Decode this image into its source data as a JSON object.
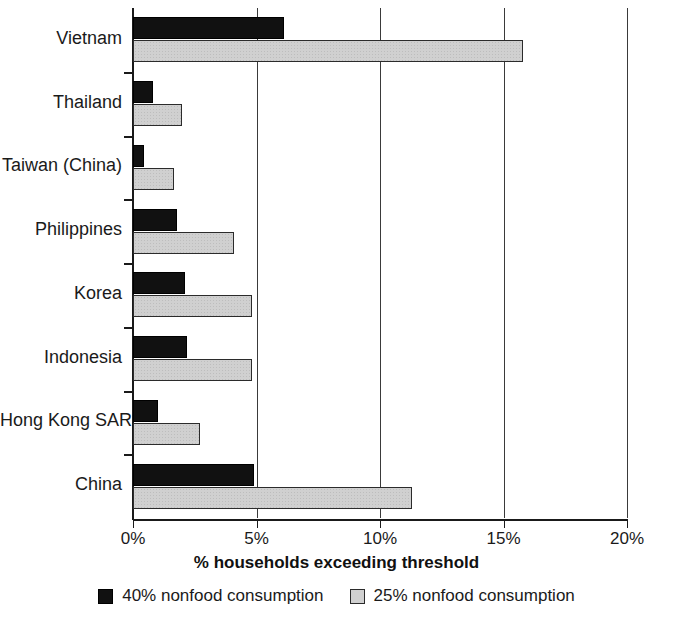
{
  "chart_data": {
    "type": "bar",
    "orientation": "horizontal",
    "title": "",
    "xlabel": "% households exceeding threshold",
    "ylabel": "",
    "xlim": [
      0,
      20
    ],
    "xticks": [
      "0%",
      "5%",
      "10%",
      "15%",
      "20%"
    ],
    "xtick_values": [
      0,
      5,
      10,
      15,
      20
    ],
    "grid": true,
    "grid_axis": "x",
    "legend_position": "bottom",
    "categories": [
      "Vietnam",
      "Thailand",
      "Taiwan (China)",
      "Philippines",
      "Korea",
      "Indonesia",
      "Hong Kong SAR",
      "China"
    ],
    "series": [
      {
        "name": "40% nonfood consumption",
        "color": "#111111",
        "values": [
          6.1,
          0.8,
          0.45,
          1.8,
          2.1,
          2.2,
          1.0,
          4.9
        ]
      },
      {
        "name": "25% nonfood consumption",
        "color": "#d0d0d0",
        "values": [
          15.8,
          2.0,
          1.65,
          4.1,
          4.8,
          4.8,
          2.7,
          11.3
        ]
      }
    ]
  },
  "axis": {
    "x_title": "% households exceeding threshold"
  },
  "legend": {
    "items": [
      {
        "label": "40% nonfood consumption",
        "swatch": "black-square-swatch"
      },
      {
        "label": "25% nonfood consumption",
        "swatch": "gray-square-swatch"
      }
    ]
  }
}
